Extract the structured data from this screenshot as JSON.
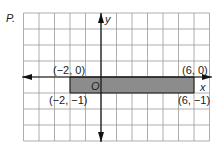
{
  "problem_label": "P.",
  "axes": {
    "x_label": "x",
    "y_label": "y",
    "origin_label": "O"
  },
  "grid": {
    "x_min": -5,
    "x_max": 7,
    "y_min": -4,
    "y_max": 4,
    "cell_px_x": 15.5,
    "cell_px_y": 16
  },
  "rectangle": {
    "fill": "#8c8c8c",
    "vertices": [
      {
        "label": "(−2, 0)",
        "x": -2,
        "y": 0
      },
      {
        "label": "(6, 0)",
        "x": 6,
        "y": 0
      },
      {
        "label": "(6, −1)",
        "x": 6,
        "y": -1
      },
      {
        "label": "(−2, −1)",
        "x": -2,
        "y": -1
      }
    ]
  },
  "colors": {
    "grid": "#9a9a9a",
    "axis": "#111111",
    "rect_fill": "#8c8c8c",
    "rect_stroke": "#111111"
  }
}
